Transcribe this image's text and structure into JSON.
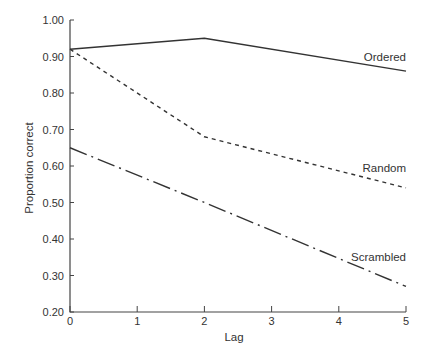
{
  "chart_data": {
    "type": "line",
    "title": "",
    "xlabel": "Lag",
    "ylabel": "Proportion correct",
    "xlim": [
      0,
      5
    ],
    "ylim": [
      0.2,
      1.0
    ],
    "x_ticks": [
      "0",
      "1",
      "2",
      "3",
      "4",
      "5"
    ],
    "y_ticks": [
      "1.00",
      "0.90",
      "0.80",
      "0.70",
      "0.60",
      "0.50",
      "0.40",
      "0.30",
      "0.20"
    ],
    "grid": false,
    "legend": "inline labels at line ends (right)",
    "x": [
      0,
      2,
      5
    ],
    "series": [
      {
        "name": "Ordered",
        "values": [
          0.92,
          0.95,
          0.86
        ],
        "style": "solid",
        "color": "#333333"
      },
      {
        "name": "Random",
        "values": [
          0.92,
          0.68,
          0.54
        ],
        "style": "dashed",
        "color": "#333333"
      },
      {
        "name": "Scrambled",
        "values": [
          0.65,
          0.5,
          0.27
        ],
        "style": "dash-dot",
        "color": "#333333"
      }
    ]
  },
  "labels": {
    "ordered": "Ordered",
    "random": "Random",
    "scrambled": "Scrambled",
    "xlabel": "Lag",
    "ylabel": "Proportion correct"
  }
}
